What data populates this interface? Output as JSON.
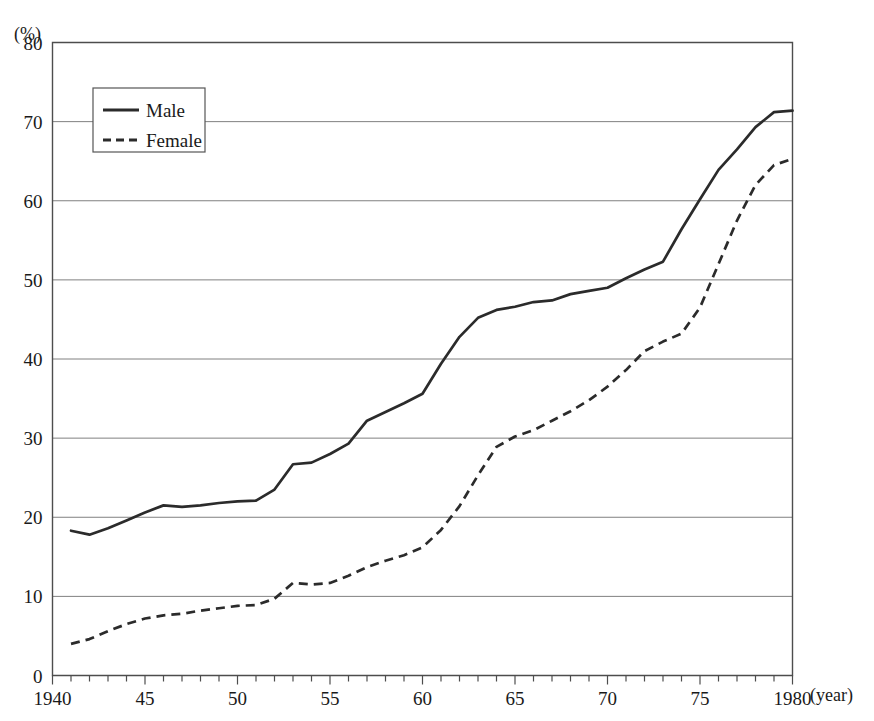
{
  "chart_data": {
    "type": "line",
    "title": "",
    "xlabel": "(year)",
    "ylabel": "(%)",
    "unit_label": "(%)",
    "xlim": [
      1940,
      1980
    ],
    "ylim": [
      0,
      80
    ],
    "grid": true,
    "legend_position": "top-left",
    "y_ticks": [
      "0",
      "10",
      "20",
      "30",
      "40",
      "50",
      "60",
      "70",
      "80"
    ],
    "y_tick_values": [
      0,
      10,
      20,
      30,
      40,
      50,
      60,
      70,
      80
    ],
    "x_ticks": [
      "1940",
      "45",
      "50",
      "55",
      "60",
      "65",
      "70",
      "75",
      "1980"
    ],
    "x_tick_values": [
      1940,
      1945,
      1950,
      1955,
      1960,
      1965,
      1970,
      1975,
      1980
    ],
    "x_minor_step": 1,
    "x": [
      1941,
      1942,
      1943,
      1944,
      1945,
      1946,
      1947,
      1948,
      1949,
      1950,
      1951,
      1952,
      1953,
      1954,
      1955,
      1956,
      1957,
      1958,
      1959,
      1960,
      1961,
      1962,
      1963,
      1964,
      1965,
      1966,
      1967,
      1968,
      1969,
      1970,
      1971,
      1972,
      1973,
      1974,
      1975,
      1976,
      1977,
      1978,
      1979,
      1980
    ],
    "series": [
      {
        "name": "Male",
        "style": "solid",
        "color": "#2b2b2b",
        "values": [
          18.3,
          17.8,
          18.6,
          19.6,
          20.6,
          21.5,
          21.3,
          21.5,
          21.8,
          22.0,
          22.1,
          23.5,
          26.7,
          26.9,
          28.0,
          29.3,
          32.2,
          33.3,
          34.4,
          35.6,
          39.4,
          42.8,
          45.2,
          46.2,
          46.6,
          47.2,
          47.4,
          48.2,
          48.6,
          49.0,
          50.2,
          51.3,
          52.3,
          56.4,
          60.2,
          63.9,
          66.5,
          69.3,
          71.2,
          71.4
        ]
      },
      {
        "name": "Female",
        "style": "dashed",
        "color": "#2b2b2b",
        "values": [
          4.0,
          4.6,
          5.6,
          6.5,
          7.2,
          7.6,
          7.8,
          8.2,
          8.5,
          8.8,
          8.9,
          9.7,
          11.7,
          11.5,
          11.7,
          12.6,
          13.7,
          14.5,
          15.2,
          16.2,
          18.4,
          21.4,
          25.3,
          28.9,
          30.2,
          31.0,
          32.2,
          33.4,
          34.8,
          36.5,
          38.6,
          41.0,
          42.2,
          43.2,
          46.5,
          52.0,
          57.5,
          62.0,
          64.5,
          65.3
        ]
      }
    ]
  },
  "legend": {
    "items": [
      {
        "label": "Male",
        "style": "solid"
      },
      {
        "label": "Female",
        "style": "dashed"
      }
    ]
  }
}
